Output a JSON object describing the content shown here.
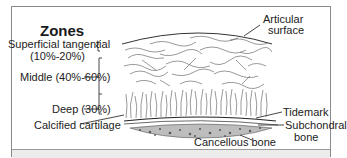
{
  "diagram": {
    "title": "Zones",
    "zones": [
      {
        "label_line1": "Superficial tangential",
        "label_line2": "(10%-20%)"
      },
      {
        "label": "Middle (40%-60%)"
      },
      {
        "label": "Deep (30%)"
      }
    ],
    "right_labels": {
      "articular_line1": "Articular",
      "articular_line2": "surface",
      "tidemark": "Tidemark",
      "subchondral_line1": "Subchondral",
      "subchondral_line2": "bone"
    },
    "bottom_labels": {
      "calcified": "Calcified cartilage",
      "cancellous": "Cancellous bone"
    }
  },
  "colors": {
    "line": "#333333",
    "frame": "#8a8a8a",
    "footer": "#ececec"
  }
}
